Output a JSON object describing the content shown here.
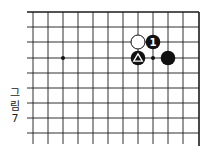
{
  "figure": {
    "caption_chars": [
      "그",
      "림",
      "7"
    ],
    "caption_text": "그림 7"
  },
  "board": {
    "region": "top-right corner",
    "edges": [
      "top",
      "right"
    ],
    "columns": 12,
    "rows": 9,
    "grid_x": [
      33,
      48,
      63,
      78,
      93,
      108,
      123,
      138,
      153,
      168,
      183,
      199
    ],
    "grid_y": [
      12,
      27,
      42,
      58,
      73,
      88,
      103,
      118,
      133
    ],
    "line_color": "#1a1a1a",
    "star_points": [
      {
        "col": 2,
        "row": 3
      }
    ],
    "stones": [
      {
        "color": "white",
        "col": 7,
        "row": 2,
        "label": ""
      },
      {
        "color": "black",
        "col": 8,
        "row": 2,
        "label": "1"
      },
      {
        "color": "black",
        "col": 7,
        "row": 3,
        "label": "",
        "marker": "triangle"
      },
      {
        "color": "black",
        "col": 9,
        "row": 3,
        "label": ""
      }
    ],
    "point_markers": [
      {
        "col": 8,
        "row": 3,
        "type": "dot"
      }
    ]
  }
}
